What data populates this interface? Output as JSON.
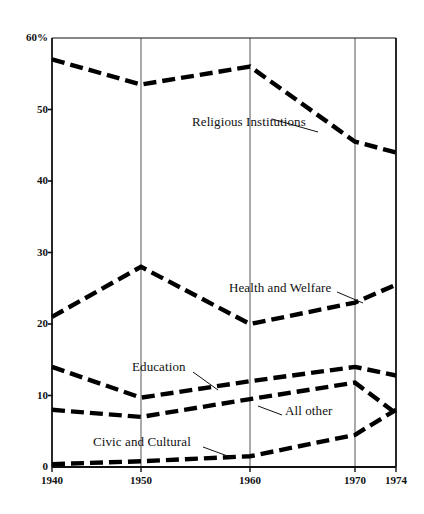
{
  "chart_data": {
    "type": "line",
    "title": "",
    "subtitle": "",
    "xlabel": "",
    "ylabel": "",
    "x": [
      1940,
      1950,
      1960,
      1970,
      1974
    ],
    "xtick_labels": [
      "1940",
      "1950",
      "1960",
      "1970",
      "1974"
    ],
    "ytick_labels": [
      "60%",
      "50",
      "40",
      "30",
      "20",
      "10",
      "0"
    ],
    "ytick_values": [
      60,
      50,
      40,
      30,
      20,
      10,
      0
    ],
    "ylim": [
      0,
      60
    ],
    "xlim": [
      1940,
      1974
    ],
    "grid": "vertical-only",
    "legend_position": "inline-annotations",
    "line_style": "dashed",
    "line_color": "#000000",
    "series": [
      {
        "name": "Religious Institutions",
        "values": [
          57.0,
          53.5,
          56.0,
          45.5,
          44.0
        ],
        "label_x": 192,
        "label_y": 123,
        "leader": [
          272,
          119,
          318,
          132
        ]
      },
      {
        "name": "Health and Welfare",
        "values": [
          21.0,
          28.0,
          20.0,
          23.0,
          25.5
        ],
        "label_x": 229,
        "label_y": 289,
        "leader": [
          337,
          292,
          363,
          303
        ]
      },
      {
        "name": "Education",
        "values": [
          14.0,
          9.7,
          12.0,
          14.0,
          12.8
        ],
        "label_x": 132,
        "label_y": 368,
        "leader": [
          193,
          372,
          218,
          390
        ]
      },
      {
        "name": "All other",
        "values": [
          8.0,
          7.0,
          9.5,
          11.8,
          7.5
        ],
        "label_x": 285,
        "label_y": 412,
        "leader": [
          258,
          406,
          282,
          415
        ]
      },
      {
        "name": "Civic and Cultural",
        "values": [
          0.4,
          0.8,
          1.5,
          4.5,
          8.0
        ],
        "label_x": 93,
        "label_y": 443,
        "leader": [
          203,
          447,
          233,
          458
        ]
      }
    ]
  },
  "axes": {
    "y_ticks": [
      {
        "label": "60%",
        "value": 60
      },
      {
        "label": "50",
        "value": 50
      },
      {
        "label": "40",
        "value": 40
      },
      {
        "label": "30",
        "value": 30
      },
      {
        "label": "20",
        "value": 20
      },
      {
        "label": "10",
        "value": 10
      },
      {
        "label": "0",
        "value": 0
      }
    ],
    "x_ticks": [
      {
        "label": "1940",
        "value": 1940
      },
      {
        "label": "1950",
        "value": 1950
      },
      {
        "label": "1960",
        "value": 1960
      },
      {
        "label": "1970",
        "value": 1970
      },
      {
        "label": "1974",
        "value": 1974
      }
    ]
  },
  "colors": {
    "line": "#000000",
    "axis": "#111111",
    "grid": "#555555",
    "background": "#ffffff"
  }
}
